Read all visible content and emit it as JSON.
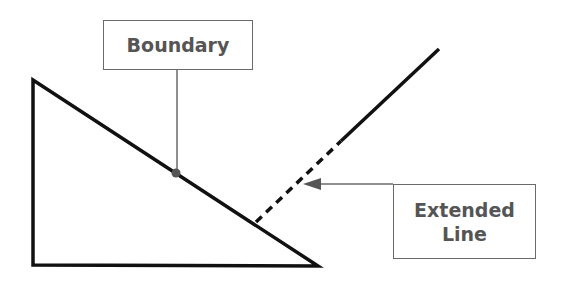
{
  "diagram": {
    "labels": {
      "boundary": "Boundary",
      "extended_line_1": "Extended",
      "extended_line_2": "Line"
    },
    "colors": {
      "shape_stroke": "#111111",
      "callout_stroke": "#6a6a6a",
      "label_text": "#555555"
    },
    "shapes": {
      "triangle": [
        [
          33,
          80
        ],
        [
          33,
          265
        ],
        [
          318,
          266
        ]
      ],
      "extension_solid": [
        [
          341,
          141
        ],
        [
          439,
          49
        ]
      ],
      "extension_dashed": [
        [
          256,
          222
        ],
        [
          341,
          141
        ]
      ],
      "boundary_point": [
        176,
        173
      ]
    }
  }
}
